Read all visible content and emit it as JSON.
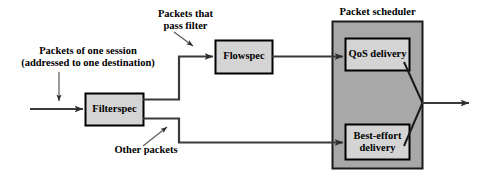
{
  "diagram": {
    "colors": {
      "line": "#3a3a3a",
      "box_fill": "#d4d4d4",
      "box_stroke": "#000000",
      "scheduler_fill": "#a8a8a8",
      "scheduler_stroke": "#1a1a1a",
      "text": "#000000",
      "background": "#ffffff"
    },
    "boxes": [
      {
        "id": "filterspec",
        "label": "Filterspec"
      },
      {
        "id": "flowspec",
        "label": "Flowspec"
      },
      {
        "id": "qos",
        "label": "QoS delivery"
      },
      {
        "id": "besteffort",
        "label_line1": "Best-effort",
        "label_line2": "delivery"
      }
    ],
    "groups": [
      {
        "id": "packet-scheduler",
        "label": "Packet scheduler"
      }
    ],
    "annotations": [
      {
        "id": "input-session",
        "line1": "Packets of one session",
        "line2": "(addressed to one destination)"
      },
      {
        "id": "pass-filter",
        "line1": "Packets that",
        "line2": "pass filter"
      },
      {
        "id": "other-packets",
        "line1": "Other packets"
      }
    ]
  }
}
